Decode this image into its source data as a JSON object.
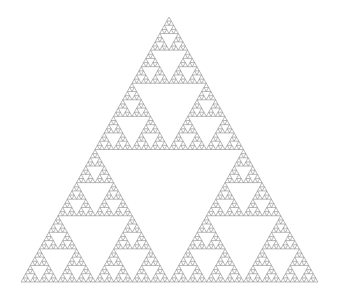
{
  "figure": {
    "background": "#ffffff",
    "stroke_color": "#8a8a8a",
    "apex": [
      169,
      17
    ],
    "base_left": [
      21,
      282
    ],
    "base_right": [
      318,
      282
    ],
    "depth": 6
  }
}
